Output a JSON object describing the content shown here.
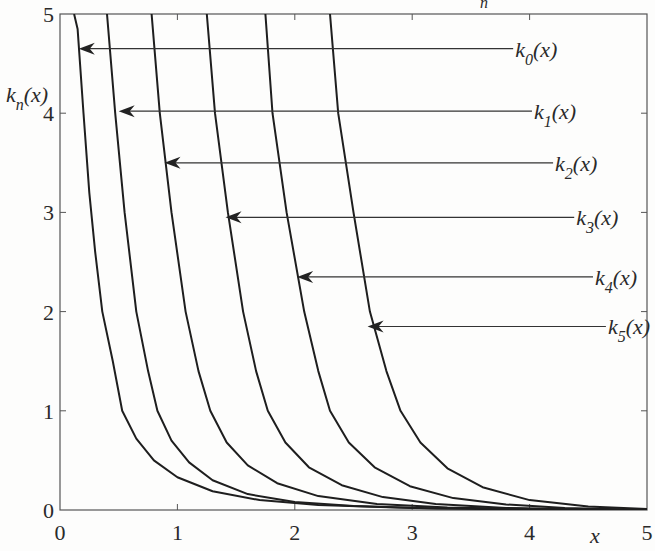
{
  "chart_data": {
    "type": "line",
    "title": "",
    "top_fragment": "n",
    "xlabel": "x",
    "ylabel": {
      "base": "k",
      "sub": "n",
      "rest": "(x)"
    },
    "xlim": [
      0,
      5
    ],
    "ylim": [
      0,
      5
    ],
    "xticks": [
      0,
      1,
      2,
      3,
      4,
      5
    ],
    "yticks": [
      0,
      1,
      2,
      3,
      4,
      5
    ],
    "grid": false,
    "legend": "annotations with arrows",
    "series": [
      {
        "name": "k0(x)",
        "label_base": "k",
        "label_sub": "0",
        "label_rest": "(x)",
        "x": [
          0.12,
          0.15,
          0.2,
          0.25,
          0.3,
          0.36,
          0.45,
          0.53,
          0.65,
          0.8,
          1.0,
          1.3,
          1.7,
          2.2,
          3.0,
          4.0,
          5.0
        ],
        "y": [
          5.0,
          4.85,
          4.0,
          3.2,
          2.6,
          2.0,
          1.5,
          1.0,
          0.72,
          0.5,
          0.33,
          0.19,
          0.1,
          0.05,
          0.02,
          0.01,
          0.0
        ],
        "arrow": {
          "tip": [
            0.16,
            4.65
          ],
          "label_at": [
            3.86,
            4.65
          ]
        }
      },
      {
        "name": "k1(x)",
        "label_base": "k",
        "label_sub": "1",
        "label_rest": "(x)",
        "x": [
          0.4,
          0.47,
          0.55,
          0.65,
          0.75,
          0.83,
          0.95,
          1.1,
          1.3,
          1.6,
          2.0,
          2.5,
          3.2,
          4.0,
          5.0
        ],
        "y": [
          5.0,
          4.0,
          3.0,
          2.0,
          1.4,
          1.0,
          0.7,
          0.48,
          0.3,
          0.16,
          0.08,
          0.04,
          0.015,
          0.005,
          0.0
        ],
        "arrow": {
          "tip": [
            0.5,
            4.02
          ],
          "label_at": [
            4.02,
            4.02
          ]
        }
      },
      {
        "name": "k2(x)",
        "label_base": "k",
        "label_sub": "2",
        "label_rest": "(x)",
        "x": [
          0.78,
          0.85,
          0.95,
          1.07,
          1.18,
          1.28,
          1.42,
          1.6,
          1.85,
          2.2,
          2.7,
          3.3,
          4.0,
          5.0
        ],
        "y": [
          5.0,
          4.0,
          3.0,
          2.0,
          1.4,
          1.0,
          0.68,
          0.45,
          0.27,
          0.14,
          0.06,
          0.025,
          0.01,
          0.0
        ],
        "arrow": {
          "tip": [
            0.89,
            3.5
          ],
          "label_at": [
            4.2,
            3.5
          ]
        }
      },
      {
        "name": "k3(x)",
        "label_base": "k",
        "label_sub": "3",
        "label_rest": "(x)",
        "x": [
          1.25,
          1.32,
          1.43,
          1.56,
          1.67,
          1.77,
          1.92,
          2.12,
          2.4,
          2.75,
          3.2,
          3.8,
          4.5,
          5.0
        ],
        "y": [
          5.0,
          4.0,
          3.0,
          2.0,
          1.4,
          1.0,
          0.68,
          0.43,
          0.25,
          0.13,
          0.06,
          0.02,
          0.008,
          0.0
        ],
        "arrow": {
          "tip": [
            1.41,
            2.95
          ],
          "label_at": [
            4.38,
            2.95
          ]
        }
      },
      {
        "name": "k4(x)",
        "label_base": "k",
        "label_sub": "4",
        "label_rest": "(x)",
        "x": [
          1.75,
          1.81,
          1.93,
          2.08,
          2.2,
          2.3,
          2.46,
          2.68,
          2.98,
          3.35,
          3.8,
          4.3,
          5.0
        ],
        "y": [
          5.0,
          4.0,
          3.0,
          2.0,
          1.4,
          1.0,
          0.68,
          0.43,
          0.24,
          0.12,
          0.055,
          0.02,
          0.0
        ],
        "arrow": {
          "tip": [
            2.02,
            2.35
          ],
          "label_at": [
            4.54,
            2.35
          ]
        }
      },
      {
        "name": "k5(x)",
        "label_base": "k",
        "label_sub": "5",
        "label_rest": "(x)",
        "x": [
          2.3,
          2.37,
          2.5,
          2.64,
          2.78,
          2.9,
          3.07,
          3.3,
          3.6,
          4.0,
          4.5,
          5.0
        ],
        "y": [
          5.0,
          4.0,
          3.0,
          2.0,
          1.4,
          1.0,
          0.68,
          0.42,
          0.23,
          0.1,
          0.035,
          0.01
        ],
        "arrow": {
          "tip": [
            2.62,
            1.85
          ],
          "label_at": [
            4.65,
            1.85
          ]
        }
      }
    ]
  }
}
